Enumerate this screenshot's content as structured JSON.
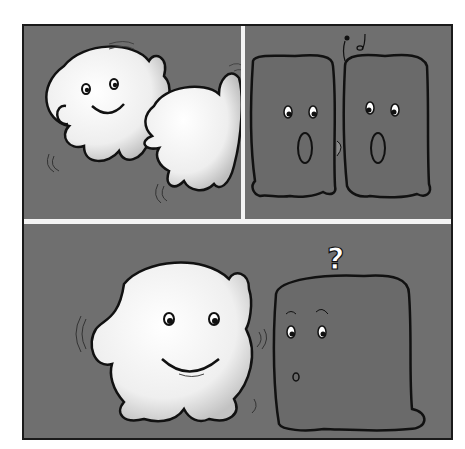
{
  "comic": {
    "title": "",
    "panels": [
      {
        "id": 1,
        "description": "Two round white blobs bump into each other, the first smiling",
        "characters": [
          "round-blob-smiling",
          "round-blob-back"
        ]
      },
      {
        "id": 2,
        "description": "Two gray square blobs face each other, kissing, with music notes above",
        "characters": [
          "square-blob-left",
          "square-blob-right"
        ],
        "symbols": [
          "music-notes"
        ]
      },
      {
        "id": 3,
        "description": "Round white blob smiles beside a confused gray square blob",
        "characters": [
          "round-blob-smiling",
          "square-blob-confused"
        ],
        "symbols": [
          "?"
        ]
      }
    ],
    "question_mark": "?",
    "colors": {
      "panel_bg": "#6f6f6f",
      "round_blob": "#f2f2f2",
      "square_blob": "#6a6a6a",
      "outline": "#111111",
      "gutter": "#f4f4f4"
    }
  }
}
